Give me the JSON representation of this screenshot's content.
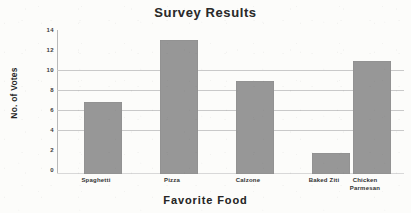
{
  "chart_data": {
    "type": "bar",
    "title": "Survey Results",
    "xlabel": "Favorite Food",
    "ylabel": "No. of Votes",
    "categories": [
      "Spaghetti",
      "Pizza",
      "Calzone",
      "Baked Ziti",
      "Chicken Parmesan"
    ],
    "values": [
      7,
      13,
      9,
      2,
      11
    ],
    "ylim": [
      0,
      14
    ],
    "ytick_labels": [
      "14",
      "12",
      "10",
      "8",
      "6",
      "4",
      "2",
      "0"
    ],
    "ytick_values": [
      14,
      12,
      10,
      8,
      6,
      4,
      2,
      0
    ],
    "gridlines_at": [
      10,
      8,
      6,
      4
    ],
    "grid": true,
    "legend": false,
    "bar_color": "#979797",
    "grid_color": "#c9c9c9",
    "axis_color": "#b9b9b9",
    "background_color": "#fcfcfa",
    "text_color": "#262626"
  }
}
